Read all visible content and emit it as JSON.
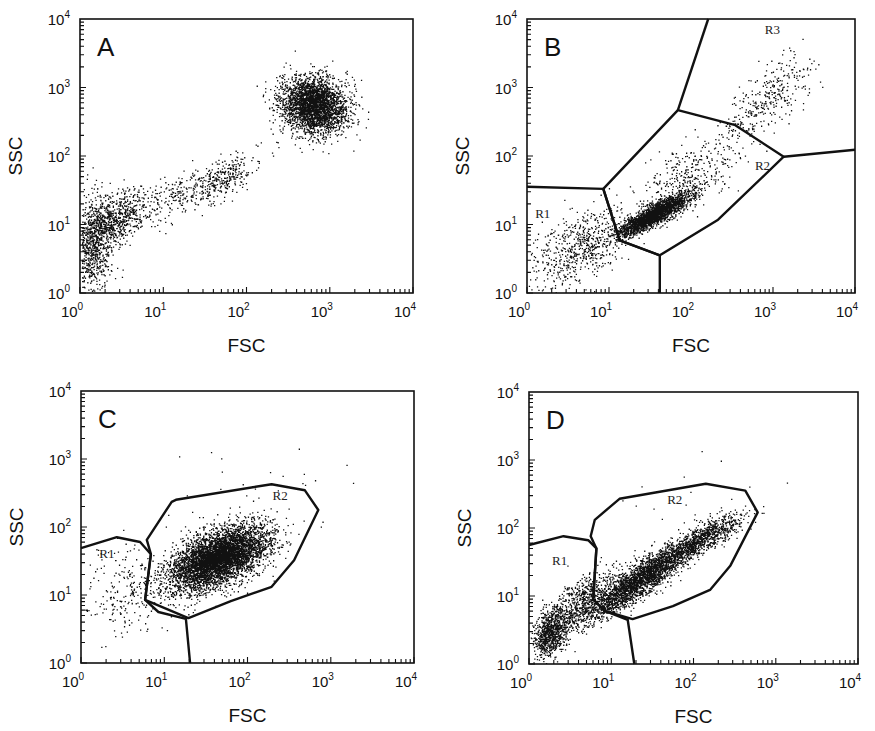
{
  "figure": {
    "x_axis_label": "FSC",
    "y_axis_label": "SSC",
    "tick_labels": [
      "10",
      "10",
      "10",
      "10",
      "10"
    ],
    "tick_exponents": [
      "0",
      "1",
      "2",
      "3",
      "4"
    ]
  },
  "chart_data": [
    {
      "type": "scatter",
      "panel": "A",
      "title": "A",
      "xlabel": "FSC",
      "ylabel": "SSC",
      "xscale": "log",
      "yscale": "log",
      "xlim": [
        1,
        10000
      ],
      "ylim": [
        1,
        10000
      ],
      "x_ticks": [
        "10^0",
        "10^1",
        "10^2",
        "10^3",
        "10^4"
      ],
      "y_ticks": [
        "10^0",
        "10^1",
        "10^2",
        "10^3",
        "10^4"
      ],
      "grid": false,
      "box": {
        "x0": 80,
        "y0": 19,
        "x1": 413,
        "y1": 293
      },
      "clusters": [
        {
          "name": "debris-low",
          "center_log": [
            0.15,
            0.75
          ],
          "spread_log": [
            0.12,
            0.35
          ],
          "n": 900,
          "corr": 0.2
        },
        {
          "name": "small-events",
          "center_log": [
            0.45,
            1.1
          ],
          "spread_log": [
            0.18,
            0.2
          ],
          "n": 550,
          "corr": 0.5
        },
        {
          "name": "diagonal-trail",
          "center_log": [
            1.2,
            1.45
          ],
          "spread_log": [
            0.45,
            0.28
          ],
          "n": 350,
          "corr": 0.85
        },
        {
          "name": "mid-cluster",
          "center_log": [
            1.7,
            1.65
          ],
          "spread_log": [
            0.18,
            0.17
          ],
          "n": 220,
          "corr": 0.6
        },
        {
          "name": "large-cells",
          "center_log": [
            2.8,
            2.75
          ],
          "spread_log": [
            0.2,
            0.2
          ],
          "n": 3000,
          "corr": -0.1
        }
      ],
      "gates": [],
      "gate_labels": []
    },
    {
      "type": "scatter",
      "panel": "B",
      "title": "B",
      "xlabel": "FSC",
      "ylabel": "SSC",
      "xscale": "log",
      "yscale": "log",
      "xlim": [
        1,
        10000
      ],
      "ylim": [
        1,
        10000
      ],
      "x_ticks": [
        "10^0",
        "10^1",
        "10^2",
        "10^3",
        "10^4"
      ],
      "y_ticks": [
        "10^0",
        "10^1",
        "10^2",
        "10^3",
        "10^4"
      ],
      "grid": false,
      "box": {
        "x0": 527,
        "y0": 19,
        "x1": 855,
        "y1": 293
      },
      "clusters": [
        {
          "name": "R1-debris",
          "center_log": [
            0.6,
            0.65
          ],
          "spread_log": [
            0.32,
            0.3
          ],
          "n": 650,
          "corr": 0.55
        },
        {
          "name": "R2-dense",
          "center_log": [
            1.55,
            1.15
          ],
          "spread_log": [
            0.22,
            0.16
          ],
          "n": 2400,
          "corr": 0.88
        },
        {
          "name": "R2-sparse",
          "center_log": [
            2.0,
            1.75
          ],
          "spread_log": [
            0.35,
            0.3
          ],
          "n": 350,
          "corr": 0.6
        },
        {
          "name": "R3-large",
          "center_log": [
            2.95,
            2.85
          ],
          "spread_log": [
            0.28,
            0.3
          ],
          "n": 320,
          "corr": 0.7
        }
      ],
      "gates": [
        {
          "name": "R1-R2-divider",
          "closed": false,
          "points_log": [
            [
              0.0,
              1.55
            ],
            [
              0.93,
              1.52
            ],
            [
              1.13,
              0.77
            ],
            [
              1.62,
              0.55
            ],
            [
              1.62,
              0.0
            ]
          ]
        },
        {
          "name": "R2",
          "closed": true,
          "points_log": [
            [
              0.93,
              1.52
            ],
            [
              1.84,
              2.67
            ],
            [
              2.54,
              2.45
            ],
            [
              3.13,
              1.99
            ],
            [
              2.33,
              1.07
            ],
            [
              1.62,
              0.55
            ],
            [
              1.13,
              0.77
            ]
          ]
        },
        {
          "name": "R3-left-divider",
          "closed": false,
          "points_log": [
            [
              1.84,
              2.67
            ],
            [
              2.21,
              4.0
            ]
          ]
        },
        {
          "name": "R3-bottom-divider",
          "closed": false,
          "points_log": [
            [
              3.13,
              1.99
            ],
            [
              4.0,
              2.09
            ]
          ]
        }
      ],
      "gate_labels": [
        {
          "text": "R1",
          "pos_log": [
            0.1,
            1.1
          ]
        },
        {
          "text": "R2",
          "pos_log": [
            2.78,
            1.8
          ]
        },
        {
          "text": "R3",
          "pos_log": [
            2.9,
            3.78
          ]
        }
      ]
    },
    {
      "type": "scatter",
      "panel": "C",
      "title": "C",
      "xlabel": "FSC",
      "ylabel": "SSC",
      "xscale": "log",
      "yscale": "log",
      "xlim": [
        1,
        10000
      ],
      "ylim": [
        1,
        10000
      ],
      "x_ticks": [
        "10^0",
        "10^1",
        "10^2",
        "10^3",
        "10^4"
      ],
      "y_ticks": [
        "10^0",
        "10^1",
        "10^2",
        "10^3",
        "10^4"
      ],
      "grid": false,
      "box": {
        "x0": 81,
        "y0": 391,
        "x1": 414,
        "y1": 663
      },
      "clusters": [
        {
          "name": "R1-events",
          "center_log": [
            0.55,
            1.05
          ],
          "spread_log": [
            0.25,
            0.35
          ],
          "n": 230,
          "corr": 0.1
        },
        {
          "name": "R2-main",
          "center_log": [
            1.65,
            1.55
          ],
          "spread_log": [
            0.3,
            0.24
          ],
          "n": 5200,
          "corr": 0.55
        },
        {
          "name": "outliers",
          "center_log": [
            2.0,
            2.6
          ],
          "spread_log": [
            0.8,
            0.3
          ],
          "n": 25,
          "corr": 0.3
        }
      ],
      "gates": [
        {
          "name": "R1",
          "closed": false,
          "points_log": [
            [
              0.0,
              1.69
            ],
            [
              0.43,
              1.85
            ],
            [
              0.71,
              1.78
            ],
            [
              0.84,
              1.6
            ],
            [
              0.77,
              0.93
            ],
            [
              0.93,
              0.75
            ],
            [
              1.26,
              0.65
            ],
            [
              1.31,
              0.0
            ]
          ]
        },
        {
          "name": "R2",
          "closed": true,
          "points_log": [
            [
              0.79,
              1.81
            ],
            [
              1.09,
              2.37
            ],
            [
              1.14,
              2.4
            ],
            [
              2.29,
              2.63
            ],
            [
              2.69,
              2.54
            ],
            [
              2.85,
              2.25
            ],
            [
              2.56,
              1.51
            ],
            [
              2.29,
              1.12
            ],
            [
              1.8,
              0.91
            ],
            [
              1.29,
              0.66
            ],
            [
              0.77,
              0.93
            ],
            [
              0.84,
              1.6
            ]
          ]
        }
      ],
      "gate_labels": [
        {
          "text": "R1",
          "pos_log": [
            0.22,
            1.55
          ]
        },
        {
          "text": "R2",
          "pos_log": [
            2.3,
            2.4
          ]
        }
      ]
    },
    {
      "type": "scatter",
      "panel": "D",
      "title": "D",
      "xlabel": "FSC",
      "ylabel": "SSC",
      "xscale": "log",
      "yscale": "log",
      "xlim": [
        1,
        10000
      ],
      "ylim": [
        1,
        10000
      ],
      "x_ticks": [
        "10^0",
        "10^1",
        "10^2",
        "10^3",
        "10^4"
      ],
      "y_ticks": [
        "10^0",
        "10^1",
        "10^2",
        "10^3",
        "10^4"
      ],
      "grid": false,
      "box": {
        "x0": 529,
        "y0": 392,
        "x1": 858,
        "y1": 664
      },
      "clusters": [
        {
          "name": "R1-dense-low",
          "center_log": [
            0.25,
            0.45
          ],
          "spread_log": [
            0.1,
            0.18
          ],
          "n": 800,
          "corr": 0.3
        },
        {
          "name": "R1-spread",
          "center_log": [
            0.6,
            0.9
          ],
          "spread_log": [
            0.2,
            0.25
          ],
          "n": 600,
          "corr": 0.7
        },
        {
          "name": "R2-diagonal",
          "center_log": [
            1.35,
            1.25
          ],
          "spread_log": [
            0.35,
            0.3
          ],
          "n": 2800,
          "corr": 0.9
        },
        {
          "name": "R2-upper",
          "center_log": [
            2.1,
            1.85
          ],
          "spread_log": [
            0.25,
            0.18
          ],
          "n": 800,
          "corr": 0.85
        },
        {
          "name": "outliers",
          "center_log": [
            1.9,
            2.5
          ],
          "spread_log": [
            0.5,
            0.3
          ],
          "n": 15,
          "corr": 0.2
        }
      ],
      "gates": [
        {
          "name": "R1",
          "closed": false,
          "points_log": [
            [
              0.0,
              1.75
            ],
            [
              0.42,
              1.88
            ],
            [
              0.72,
              1.82
            ],
            [
              0.82,
              1.7
            ],
            [
              0.78,
              0.95
            ],
            [
              0.92,
              0.78
            ],
            [
              1.2,
              0.65
            ],
            [
              1.28,
              0.0
            ]
          ]
        },
        {
          "name": "R2",
          "closed": true,
          "points_log": [
            [
              0.75,
              1.88
            ],
            [
              0.8,
              2.12
            ],
            [
              1.1,
              2.43
            ],
            [
              2.15,
              2.65
            ],
            [
              2.63,
              2.55
            ],
            [
              2.78,
              2.23
            ],
            [
              2.45,
              1.45
            ],
            [
              2.2,
              1.09
            ],
            [
              1.75,
              0.85
            ],
            [
              1.26,
              0.66
            ],
            [
              0.92,
              0.78
            ],
            [
              0.78,
              0.95
            ],
            [
              0.82,
              1.7
            ]
          ]
        }
      ],
      "gate_labels": [
        {
          "text": "R1",
          "pos_log": [
            0.28,
            1.45
          ]
        },
        {
          "text": "R2",
          "pos_log": [
            1.68,
            2.35
          ]
        }
      ]
    }
  ]
}
